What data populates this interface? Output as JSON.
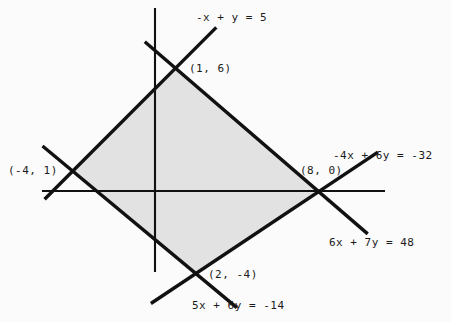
{
  "figure": {
    "kind": "linear-programming-feasible-region",
    "fill_color": "#e2e2e2",
    "line_color": "#111111",
    "axis_color": "#111111",
    "background": "#fbfbfb"
  },
  "chart_data": {
    "type": "scatter",
    "title": "",
    "xlabel": "",
    "ylabel": "",
    "grid": false,
    "legend": null,
    "xlim": [
      -5.5,
      11.3
    ],
    "ylim": [
      -6.2,
      8.9
    ],
    "axes": {
      "x_axis_y": 0,
      "y_axis_x": 0,
      "x_axis_pixel_span": [
        42,
        385
      ],
      "y_axis_pixel_span": [
        8,
        272
      ],
      "origin_pixel": [
        155,
        191
      ],
      "pixels_per_unit": 20.45
    },
    "region": {
      "shaded": true,
      "shape": "quadrilateral",
      "fill": "#e2e2e2",
      "vertices": [
        {
          "label": "(1, 6)",
          "x": 1,
          "y": 6
        },
        {
          "label": "(-4, 1)",
          "x": -4,
          "y": 1
        },
        {
          "label": "(2, -4)",
          "x": 2,
          "y": -4
        },
        {
          "label": "(8, 0)",
          "x": 8,
          "y": 0
        }
      ]
    },
    "lines": [
      {
        "label": "-x + y = 5",
        "a": -1,
        "b": 1,
        "c": 5,
        "through": [
          {
            "x": -4,
            "y": 1
          },
          {
            "x": 1,
            "y": 6
          }
        ],
        "draw_from": {
          "x": -5.4,
          "y": -0.4
        },
        "draw_to": {
          "x": 3.0,
          "y": 8.0
        }
      },
      {
        "label": "-4x + 6y = -32",
        "a": -4,
        "b": 6,
        "c": -32,
        "through": [
          {
            "x": 2,
            "y": -4
          },
          {
            "x": 8,
            "y": 0
          }
        ],
        "draw_from": {
          "x": -0.2,
          "y": -5.5
        },
        "draw_to": {
          "x": 10.9,
          "y": 1.9
        }
      },
      {
        "label": "6x + 7y = 48",
        "a": 6,
        "b": 7,
        "c": 48,
        "through": [
          {
            "x": 1,
            "y": 6
          },
          {
            "x": 8,
            "y": 0
          }
        ],
        "draw_from": {
          "x": -0.5,
          "y": 7.3
        },
        "draw_to": {
          "x": 10.4,
          "y": -2.1
        }
      },
      {
        "label": "5x + 6y = -14",
        "a": 5,
        "b": 6,
        "c": -14,
        "through": [
          {
            "x": -4,
            "y": 1
          },
          {
            "x": 2,
            "y": -4
          }
        ],
        "draw_from": {
          "x": -5.5,
          "y": 2.2
        },
        "draw_to": {
          "x": 4.0,
          "y": -5.7
        }
      }
    ],
    "point_labels": [
      {
        "text": "(1, 6)",
        "x": 1,
        "y": 6
      },
      {
        "text": "(-4, 1)",
        "x": -4,
        "y": 1
      },
      {
        "text": "(8, 0)",
        "x": 8,
        "y": 0
      },
      {
        "text": "(2, -4)",
        "x": 2,
        "y": -4
      }
    ],
    "equation_labels": [
      "-x + y = 5",
      "-4x + 6y = -32",
      "6x + 7y = 48",
      "5x + 6y = -14"
    ]
  },
  "labels": {
    "eq_top": "-x + y = 5",
    "eq_right": "-4x + 6y = -32",
    "eq_lower_right": "6x + 7y = 48",
    "eq_bottom": "5x + 6y = -14",
    "vertex_top": "(1, 6)",
    "vertex_left": "(-4, 1)",
    "vertex_right": "(8, 0)",
    "vertex_bottom": "(2, -4)"
  }
}
